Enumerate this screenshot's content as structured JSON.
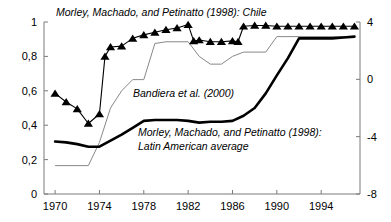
{
  "chart_data": {
    "type": "line",
    "title": "",
    "xlabel": "",
    "ylabel": "",
    "grid": false,
    "legend_position": "inline-annotations",
    "x_axis": {
      "ticks": [
        1970,
        1974,
        1978,
        1982,
        1986,
        1990,
        1994
      ],
      "tick_labels": [
        "1970",
        "1974",
        "1978",
        "1982",
        "1986",
        "1990",
        "1994"
      ],
      "xlim": [
        1969.0,
        1997.5
      ]
    },
    "y_axis_left": {
      "ticks": [
        0,
        0.2,
        0.4,
        0.6,
        0.8,
        1
      ],
      "tick_labels": [
        "0",
        "0,2",
        "0,4",
        "0,6",
        "0,8",
        "1"
      ],
      "ylim": [
        0,
        1
      ]
    },
    "y_axis_right": {
      "ticks": [
        -8,
        -4,
        0,
        4
      ],
      "tick_labels": [
        "-8",
        "-4",
        "0",
        "4"
      ],
      "ylim": [
        -8,
        4
      ]
    },
    "series": [
      {
        "name": "Morley, Machado, and Petinatto (1998): Chile",
        "style": "line-with-triangle-markers",
        "marker": "triangle-up",
        "color": "#000000",
        "line_width": 1.1,
        "axis": "left",
        "x": [
          1970,
          1971,
          1972,
          1973,
          1974,
          1974.5,
          1975,
          1976,
          1977,
          1978,
          1979,
          1980,
          1981,
          1982,
          1982.5,
          1983,
          1984,
          1985,
          1986,
          1986.5,
          1987,
          1988,
          1989,
          1990,
          1991,
          1992,
          1993,
          1994,
          1995,
          1996,
          1997
        ],
        "values": [
          0.585,
          0.535,
          0.495,
          0.41,
          0.465,
          0.8,
          0.855,
          0.86,
          0.905,
          0.925,
          0.94,
          0.955,
          0.965,
          0.985,
          0.89,
          0.895,
          0.885,
          0.885,
          0.89,
          0.885,
          0.975,
          0.98,
          0.98,
          0.975,
          0.975,
          0.975,
          0.975,
          0.975,
          0.975,
          0.975,
          0.975
        ]
      },
      {
        "name": "Bandiera et al. (2000)",
        "style": "thin-line",
        "marker": "none",
        "color": "#888888",
        "line_width": 1.0,
        "axis": "left",
        "x": [
          1970,
          1973,
          1974,
          1975,
          1976,
          1977,
          1978,
          1979,
          1980,
          1982,
          1983,
          1984,
          1985,
          1986,
          1987,
          1989,
          1990,
          1991,
          1992,
          1997
        ],
        "values": [
          0.165,
          0.165,
          0.3,
          0.5,
          0.6,
          0.665,
          0.665,
          0.875,
          0.885,
          0.885,
          0.8,
          0.755,
          0.755,
          0.8,
          0.825,
          0.825,
          0.915,
          0.915,
          0.915,
          0.915
        ]
      },
      {
        "name": "Morley, Machado, and Petinatto (1998): Latin American average",
        "style": "thick-line",
        "marker": "none",
        "color": "#000000",
        "line_width": 2.6,
        "axis": "left",
        "x": [
          1970,
          1971,
          1972,
          1973,
          1974,
          1975,
          1976,
          1977,
          1978,
          1979,
          1980,
          1981,
          1982,
          1983,
          1984,
          1985,
          1986,
          1987,
          1988,
          1989,
          1990,
          1991,
          1992,
          1993,
          1994,
          1995,
          1996,
          1997
        ],
        "values": [
          0.305,
          0.3,
          0.29,
          0.275,
          0.275,
          0.31,
          0.345,
          0.385,
          0.425,
          0.43,
          0.43,
          0.43,
          0.425,
          0.415,
          0.42,
          0.42,
          0.425,
          0.455,
          0.5,
          0.585,
          0.69,
          0.79,
          0.905,
          0.905,
          0.905,
          0.905,
          0.91,
          0.915
        ]
      }
    ],
    "annotations": [
      {
        "id": "chile-label",
        "text": "Morley, Machado, and Petinatto (1998): Chile",
        "x_px": 56,
        "y_px": 16,
        "italic": true
      },
      {
        "id": "bandiera-label",
        "text": "Bandiera et al. (2000)",
        "x_px": 133,
        "y_px": 97,
        "italic": true
      },
      {
        "id": "latam-label-line1",
        "text": "Morley, Machado, and Petinatto (1998):",
        "x_px": 138,
        "y_px": 136,
        "italic": true
      },
      {
        "id": "latam-label-line2",
        "text": "Latin American average",
        "x_px": 138,
        "y_px": 150,
        "italic": true
      }
    ]
  },
  "colors": {
    "axis": "#7a7a7a",
    "thick_line": "#000000",
    "thin_line": "#8c8c8c",
    "marker": "#000000",
    "text": "#000000",
    "background": "#ffffff"
  }
}
